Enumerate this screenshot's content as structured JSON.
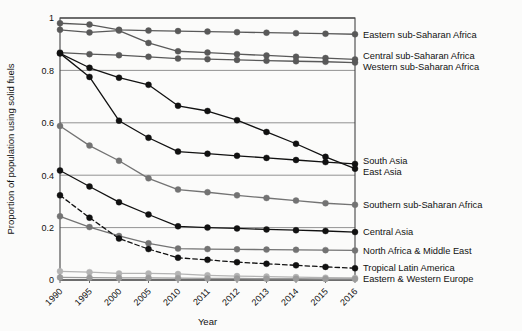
{
  "chart_data": {
    "type": "line",
    "title": "",
    "xlabel": "Year",
    "ylabel": "Proportion of population using solid fuels",
    "x": [
      "1990",
      "1995",
      "2000",
      "2005",
      "2010",
      "2011",
      "2012",
      "2013",
      "2014",
      "2015",
      "2016"
    ],
    "xlim": [
      0,
      10
    ],
    "ylim": [
      0,
      1
    ],
    "yticks": [
      "0",
      "0.2",
      "0.4",
      "0.6",
      "0.8",
      "1"
    ],
    "ytick_values": [
      0,
      0.2,
      0.4,
      0.6,
      0.8,
      1
    ],
    "grid": "horizontal",
    "legend_position": "right-inline",
    "series": [
      {
        "name": "Eastern sub-Saharan Africa",
        "color": "#595959",
        "style": "solid",
        "values": [
          0.98,
          0.975,
          0.955,
          0.952,
          0.95,
          0.948,
          0.946,
          0.944,
          0.942,
          0.94,
          0.938
        ]
      },
      {
        "name": "Central sub-Saharan Africa",
        "color": "#595959",
        "style": "solid",
        "values": [
          0.955,
          0.945,
          0.952,
          0.905,
          0.873,
          0.868,
          0.862,
          0.857,
          0.852,
          0.847,
          0.842
        ]
      },
      {
        "name": "Western sub-Saharan Africa",
        "color": "#595959",
        "style": "solid",
        "values": [
          0.868,
          0.862,
          0.858,
          0.852,
          0.845,
          0.843,
          0.84,
          0.837,
          0.835,
          0.833,
          0.83
        ]
      },
      {
        "name": "South Asia",
        "color": "#111111",
        "style": "solid",
        "values": [
          0.865,
          0.775,
          0.608,
          0.543,
          0.49,
          0.482,
          0.474,
          0.466,
          0.458,
          0.45,
          0.443
        ]
      },
      {
        "name": "East Asia",
        "color": "#111111",
        "style": "solid",
        "values": [
          0.865,
          0.81,
          0.772,
          0.745,
          0.665,
          0.645,
          0.61,
          0.565,
          0.52,
          0.47,
          0.425
        ]
      },
      {
        "name": "Southern sub-Saharan Africa",
        "color": "#737373",
        "style": "solid",
        "values": [
          0.588,
          0.513,
          0.455,
          0.388,
          0.345,
          0.335,
          0.323,
          0.313,
          0.303,
          0.293,
          0.287
        ]
      },
      {
        "name": "Central Asia",
        "color": "#111111",
        "style": "solid",
        "values": [
          0.418,
          0.357,
          0.297,
          0.25,
          0.205,
          0.2,
          0.197,
          0.193,
          0.19,
          0.187,
          0.183
        ]
      },
      {
        "name": "North Africa & Middle East",
        "color": "#737373",
        "style": "solid",
        "values": [
          0.243,
          0.202,
          0.168,
          0.14,
          0.12,
          0.118,
          0.117,
          0.116,
          0.115,
          0.114,
          0.113
        ]
      },
      {
        "name": "Tropical Latin America",
        "color": "#111111",
        "style": "dashed",
        "values": [
          0.323,
          0.238,
          0.158,
          0.118,
          0.085,
          0.077,
          0.068,
          0.062,
          0.056,
          0.05,
          0.045
        ]
      },
      {
        "name": "Eastern & Western Europe",
        "color": "#b3b3b3",
        "style": "solid",
        "values": [
          0.033,
          0.03,
          0.025,
          0.025,
          0.023,
          0.018,
          0.015,
          0.013,
          0.011,
          0.009,
          0.008
        ]
      },
      {
        "name": "High-income",
        "color": "#9a9a9a",
        "style": "solid",
        "values": [
          0.01,
          0.009,
          0.008,
          0.008,
          0.007,
          0.006,
          0.006,
          0.005,
          0.005,
          0.004,
          0.004
        ]
      }
    ],
    "legend_entries": [
      {
        "label": "Eastern sub-Saharan Africa",
        "y_value": 0.938,
        "color": "#595959",
        "style": "solid"
      },
      {
        "label": "Central sub-Saharan Africa",
        "y_value": 0.842,
        "color": "#595959",
        "style": "solid"
      },
      {
        "label": "Western sub-Saharan Africa",
        "y_value": 0.83,
        "color": "#595959",
        "style": "solid"
      },
      {
        "label": "South Asia",
        "y_value": 0.443,
        "color": "#111111",
        "style": "solid"
      },
      {
        "label": "East Asia",
        "y_value": 0.425,
        "color": "#111111",
        "style": "solid"
      },
      {
        "label": "Southern sub-Saharan Africa",
        "y_value": 0.287,
        "color": "#737373",
        "style": "solid"
      },
      {
        "label": "Central Asia",
        "y_value": 0.183,
        "color": "#111111",
        "style": "solid"
      },
      {
        "label": "North Africa & Middle East",
        "y_value": 0.113,
        "color": "#737373",
        "style": "solid"
      },
      {
        "label": "Tropical Latin America",
        "y_value": 0.045,
        "color": "#111111",
        "style": "dashed"
      },
      {
        "label": "Eastern & Western Europe",
        "y_value": 0.008,
        "color": "#b3b3b3",
        "style": "solid"
      }
    ]
  }
}
